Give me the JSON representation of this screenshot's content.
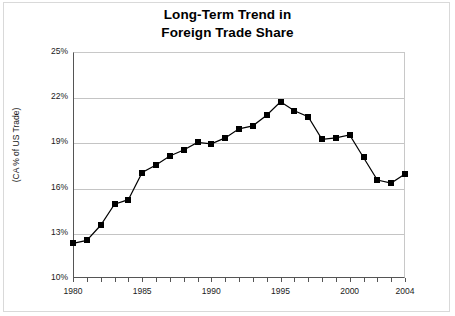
{
  "title": {
    "line1": "Long-Term Trend in",
    "line2": "Foreign Trade Share"
  },
  "chart_data": {
    "type": "line",
    "title": "Long-Term Trend in Foreign Trade Share",
    "xlabel": "",
    "ylabel": "(CA % of US Trade)",
    "ylim": [
      10,
      25
    ],
    "xlim": [
      1980,
      2004
    ],
    "ytick_labels": [
      "25%",
      "22%",
      "19%",
      "16%",
      "13%",
      "10%"
    ],
    "yticks": [
      25,
      22,
      19,
      16,
      13,
      10
    ],
    "xtick_labels": [
      "1980",
      "1985",
      "1990",
      "1995",
      "2000",
      "2004"
    ],
    "xticks": [
      1980,
      1985,
      1990,
      1995,
      2000,
      2004
    ],
    "grid": true,
    "legend": "none",
    "marker": "square",
    "marker_color": "#000000",
    "line_color": "#000000",
    "x": [
      1980,
      1981,
      1982,
      1983,
      1984,
      1985,
      1986,
      1987,
      1988,
      1989,
      1990,
      1991,
      1992,
      1993,
      1994,
      1995,
      1996,
      1997,
      1998,
      1999,
      2000,
      2001,
      2002,
      2003,
      2004
    ],
    "values": [
      12.3,
      12.5,
      13.5,
      14.9,
      15.2,
      17.0,
      17.5,
      18.1,
      18.5,
      19.0,
      18.9,
      19.3,
      19.9,
      20.1,
      20.8,
      21.7,
      21.1,
      20.7,
      19.2,
      19.3,
      19.5,
      18.0,
      16.5,
      16.3,
      16.9
    ]
  }
}
